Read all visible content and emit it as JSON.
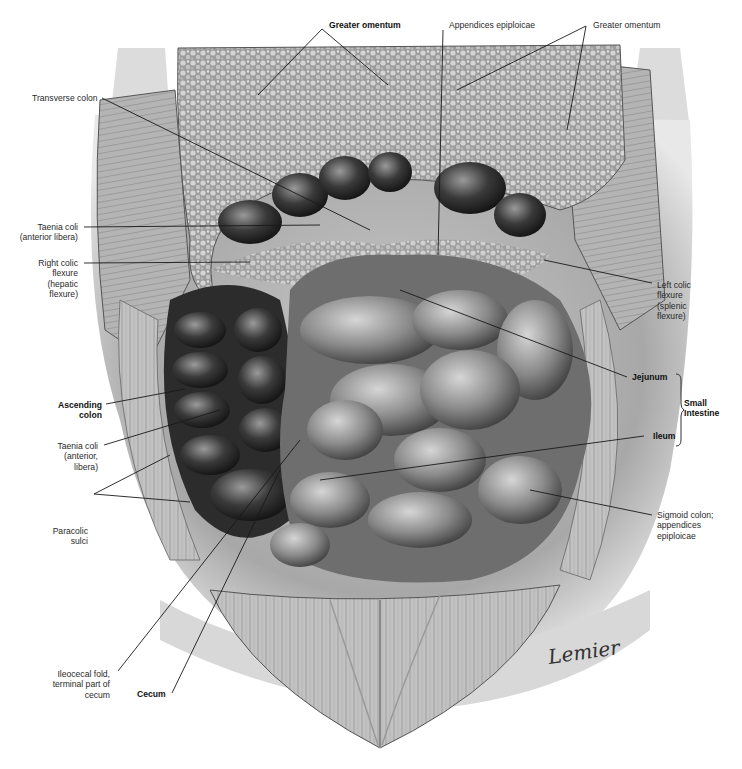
{
  "figure": {
    "artist_signature": "Lemier"
  },
  "labels": {
    "greater_omentum_left": "Greater omentum",
    "appendices_epiploicae_top": "Appendices epiploicae",
    "greater_omentum_right": "Greater omentum",
    "transverse_colon": "Transverse colon",
    "taenia_coli_top_1": "Taenia coli",
    "taenia_coli_top_2": "(anterior libera)",
    "right_colic_1": "Right colic",
    "right_colic_2": "flexure",
    "right_colic_3": "(hepatic",
    "right_colic_4": "flexure)",
    "left_colic_1": "Left colic",
    "left_colic_2": "flexure",
    "left_colic_3": "(splenic",
    "left_colic_4": "flexure)",
    "ascending_colon_1": "Ascending",
    "ascending_colon_2": "colon",
    "taenia_coli_mid_1": "Taenia coli",
    "taenia_coli_mid_2": "(anterior,",
    "taenia_coli_mid_3": "libera)",
    "jejunum": "Jejunum",
    "ileum": "Ileum",
    "small_intestine_1": "Small",
    "small_intestine_2": "Intestine",
    "paracolic_1": "Paracolic",
    "paracolic_2": "sulci",
    "sigmoid_1": "Sigmoid colon;",
    "sigmoid_2": "appendices",
    "sigmoid_3": "epiploicae",
    "ileocecal_1": "Ileocecal fold,",
    "ileocecal_2": "terminal part of",
    "ileocecal_3": "cecum",
    "cecum": "Cecum"
  },
  "colors": {
    "background": "#ffffff",
    "leader_line": "#1a1a1a",
    "label_text": "#2a2a2a"
  }
}
